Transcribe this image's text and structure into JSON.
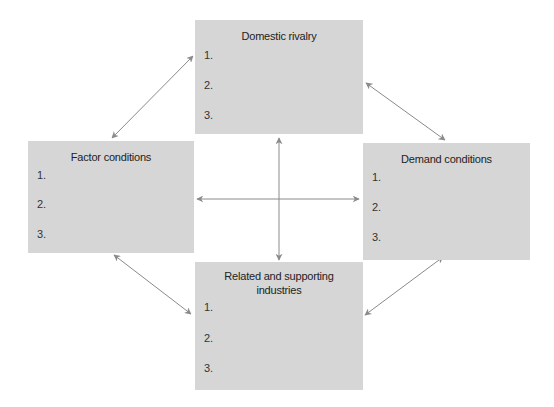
{
  "diagram": {
    "boxes": {
      "top": {
        "title": "Domestic rivalry",
        "items": [
          "1.",
          "2.",
          "3."
        ]
      },
      "left": {
        "title": "Factor conditions",
        "items": [
          "1.",
          "2.",
          "3."
        ]
      },
      "right": {
        "title": "Demand conditions",
        "items": [
          "1.",
          "2.",
          "3."
        ]
      },
      "bottom": {
        "title_line1": "Related and supporting",
        "title_line2": "industries",
        "items": [
          "1.",
          "2.",
          "3."
        ]
      }
    },
    "colors": {
      "box_fill": "#d6d6d6",
      "arrow": "#8a8a8a"
    },
    "connections": [
      {
        "from": "top",
        "to": "left",
        "type": "bidirectional"
      },
      {
        "from": "top",
        "to": "right",
        "type": "bidirectional"
      },
      {
        "from": "bottom",
        "to": "left",
        "type": "bidirectional"
      },
      {
        "from": "bottom",
        "to": "right",
        "type": "bidirectional"
      },
      {
        "from": "top",
        "to": "bottom",
        "type": "bidirectional"
      },
      {
        "from": "left",
        "to": "right",
        "type": "bidirectional"
      }
    ]
  }
}
